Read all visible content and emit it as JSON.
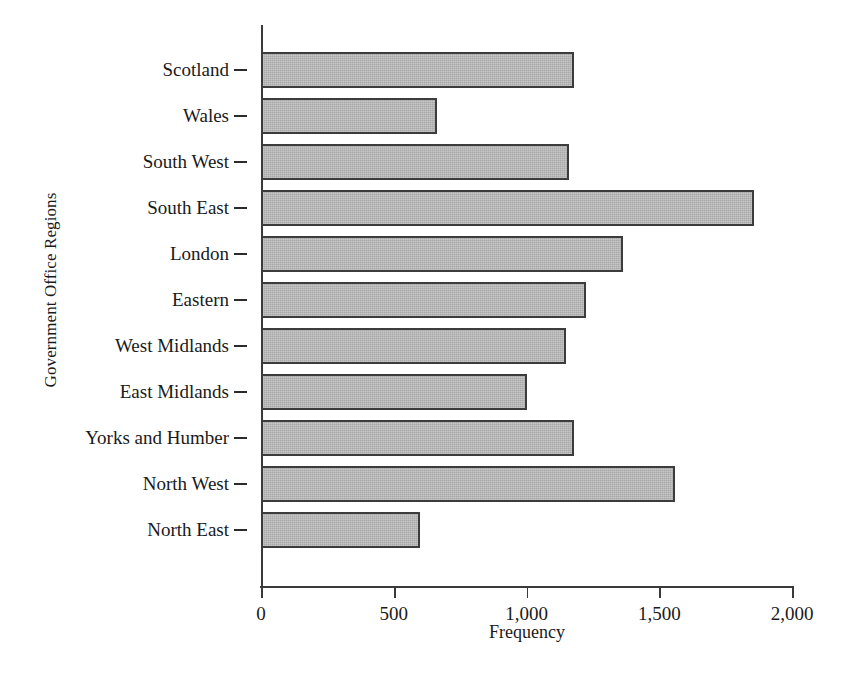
{
  "chart_data": {
    "type": "bar",
    "orientation": "horizontal",
    "title": "",
    "xlabel": "Frequency",
    "ylabel": "Government Office Regions",
    "xlim": [
      0,
      2000
    ],
    "xticks": [
      0,
      500,
      1000,
      1500,
      2000
    ],
    "xtick_labels": [
      "0",
      "500",
      "1,000",
      "1,500",
      "2,000"
    ],
    "grid": false,
    "legend": false,
    "bar_fill_color": "#a9a9a9",
    "bar_edge_color": "#3c3c3c",
    "axis_color": "#3a3a3a",
    "categories": [
      "Scotland",
      "Wales",
      "South West",
      "South East",
      "London",
      "Eastern",
      "West Midlands",
      "East Midlands",
      "Yorks and Humber",
      "North West",
      "North East"
    ],
    "values": [
      1180,
      664,
      1160,
      1855,
      1363,
      1225,
      1149,
      1000,
      1180,
      1561,
      599
    ]
  }
}
